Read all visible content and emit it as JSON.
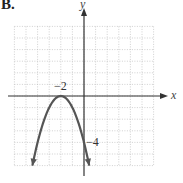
{
  "figure_label": "B.",
  "chart_data": {
    "type": "line",
    "title": "",
    "xlabel": "x",
    "ylabel": "y",
    "equation": "y = -(x + 2)^2",
    "xlim": [
      -6,
      6
    ],
    "ylim": [
      -6,
      6
    ],
    "grid": true,
    "grid_style": "dotted",
    "annotations": [
      {
        "text": "−2",
        "x": -2,
        "y": 0,
        "note": "vertex / x-intercept"
      },
      {
        "text": "−4",
        "x": 0,
        "y": -4,
        "note": "y-intercept"
      }
    ],
    "series": [
      {
        "name": "parabola",
        "color": "#555555",
        "x": [
          -4.45,
          -4,
          -3.5,
          -3,
          -2.5,
          -2,
          -1.5,
          -1,
          -0.5,
          0,
          0.45
        ],
        "y": [
          -6,
          -4,
          -2.25,
          -1,
          -0.25,
          0,
          -0.25,
          -1,
          -2.25,
          -4,
          -6
        ],
        "arrows_both_ends": true
      }
    ]
  },
  "labels": {
    "x_axis": "x",
    "y_axis": "y",
    "vertex": "−2",
    "y_intercept": "−4"
  }
}
